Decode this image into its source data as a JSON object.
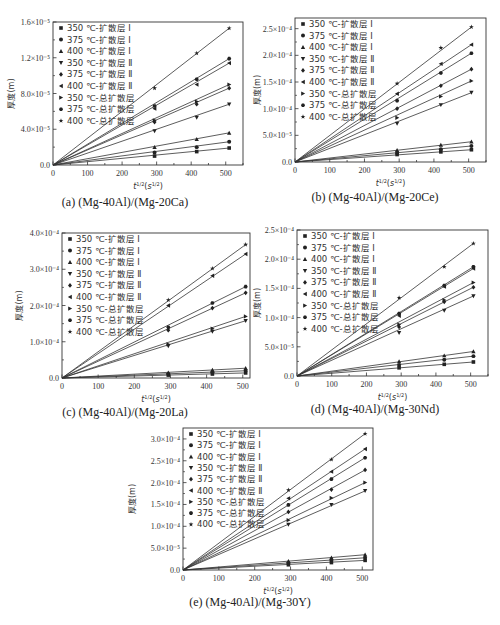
{
  "legend_labels": [
    "350 ℃-扩散层 Ⅰ",
    "375 ℃-扩散层 Ⅰ",
    "400 ℃-扩散层 Ⅰ",
    "350 ℃-扩散层 Ⅱ",
    "375 ℃-扩散层 Ⅱ",
    "400 ℃-扩散层 Ⅱ",
    "350 ℃-总扩散层",
    "375 ℃-总扩散层",
    "400 ℃-总扩散层"
  ],
  "markers": [
    "square",
    "circle",
    "triangle-up",
    "triangle-down",
    "diamond",
    "triangle-left",
    "triangle-right",
    "hexagon",
    "star"
  ],
  "chart_data": [
    {
      "id": "a",
      "type": "line",
      "title": "(a) (Mg-40Al)/(Mg-20Ca)",
      "xlabel": "t^1/2(s^1/2)",
      "ylabel": "厚度(m)",
      "xlim": [
        0,
        550
      ],
      "xticks": [
        "0",
        "100",
        "200",
        "300",
        "400",
        "500"
      ],
      "ylim": [
        0,
        16
      ],
      "yticks": [
        "0.0",
        "4.0×10⁻⁵",
        "8.0×10⁻⁵",
        "1.2×10⁻⁵",
        "1.6×10⁻⁵"
      ],
      "ytick_values": [
        0,
        4,
        8,
        12,
        16
      ],
      "x": [
        294,
        416,
        510
      ],
      "series": [
        {
          "name": "350 ℃-扩散层 Ⅰ",
          "values": [
            1.0,
            1.5,
            1.9
          ]
        },
        {
          "name": "375 ℃-扩散层 Ⅰ",
          "values": [
            1.4,
            2.0,
            2.6
          ]
        },
        {
          "name": "400 ℃-扩散层 Ⅰ",
          "values": [
            2.0,
            2.9,
            3.6
          ]
        },
        {
          "name": "350 ℃-扩散层 Ⅱ",
          "values": [
            3.8,
            5.3,
            6.8
          ]
        },
        {
          "name": "375 ℃-扩散层 Ⅱ",
          "values": [
            4.8,
            6.8,
            8.6
          ]
        },
        {
          "name": "400 ℃-扩散层 Ⅱ",
          "values": [
            6.3,
            9.0,
            11.4
          ]
        },
        {
          "name": "350 ℃-总扩散层",
          "values": [
            5.0,
            7.1,
            9.0
          ]
        },
        {
          "name": "375 ℃-总扩散层",
          "values": [
            6.6,
            9.6,
            11.9
          ]
        },
        {
          "name": "400 ℃-总扩散层",
          "values": [
            8.6,
            12.5,
            15.3
          ]
        }
      ],
      "legend_position": "upper-left"
    },
    {
      "id": "b",
      "type": "line",
      "title": "(b) (Mg-40Al)/(Mg-20Ce)",
      "xlabel": "t^1/2(s^1/2)",
      "ylabel": "厚度(m)",
      "xlim": [
        0,
        550
      ],
      "xticks": [
        "0",
        "100",
        "200",
        "300",
        "400",
        "500"
      ],
      "ylim": [
        0,
        2.7
      ],
      "yticks": [
        "0.0",
        "5.0×10⁻⁵",
        "1.0×10⁻⁴",
        "1.5×10⁻⁴",
        "2.0×10⁻⁴",
        "2.5×10⁻⁴"
      ],
      "ytick_values": [
        0,
        0.5,
        1.0,
        1.5,
        2.0,
        2.5
      ],
      "x": [
        294,
        420,
        508
      ],
      "series": [
        {
          "name": "350 ℃-扩散层 Ⅰ",
          "values": [
            0.14,
            0.19,
            0.23
          ]
        },
        {
          "name": "375 ℃-扩散层 Ⅰ",
          "values": [
            0.17,
            0.24,
            0.3
          ]
        },
        {
          "name": "400 ℃-扩散层 Ⅰ",
          "values": [
            0.22,
            0.32,
            0.38
          ]
        },
        {
          "name": "350 ℃-扩散层 Ⅱ",
          "values": [
            0.72,
            1.07,
            1.3
          ]
        },
        {
          "name": "375 ℃-扩散层 Ⅱ",
          "values": [
            1.0,
            1.43,
            1.74
          ]
        },
        {
          "name": "400 ℃-扩散层 Ⅱ",
          "values": [
            1.28,
            1.84,
            2.2
          ]
        },
        {
          "name": "350 ℃-总扩散层",
          "values": [
            0.83,
            1.23,
            1.52
          ]
        },
        {
          "name": "375 ℃-总扩散层",
          "values": [
            1.15,
            1.67,
            2.04
          ]
        },
        {
          "name": "400 ℃-总扩散层",
          "values": [
            1.47,
            2.14,
            2.53
          ]
        }
      ],
      "legend_position": "upper-left"
    },
    {
      "id": "c",
      "type": "line",
      "title": "(c) (Mg-40Al)/(Mg-20La)",
      "xlabel": "t^1/2(s^1/2)",
      "ylabel": "厚度(m)",
      "xlim": [
        0,
        520
      ],
      "xticks": [
        "0",
        "100",
        "200",
        "300",
        "400",
        "500"
      ],
      "ylim": [
        0,
        4.0
      ],
      "yticks": [
        "0.0",
        "1.0×10⁻⁴",
        "2.0×10⁻⁴",
        "3.0×10⁻⁴",
        "4.0×10⁻⁴"
      ],
      "ytick_values": [
        0,
        1.0,
        2.0,
        3.0,
        4.0
      ],
      "x": [
        294,
        416,
        508
      ],
      "series": [
        {
          "name": "350 ℃-扩散层 Ⅰ",
          "values": [
            0.08,
            0.11,
            0.14
          ]
        },
        {
          "name": "375 ℃-扩散层 Ⅰ",
          "values": [
            0.11,
            0.16,
            0.2
          ]
        },
        {
          "name": "400 ℃-扩散层 Ⅰ",
          "values": [
            0.15,
            0.22,
            0.27
          ]
        },
        {
          "name": "350 ℃-扩散层 Ⅱ",
          "values": [
            0.88,
            1.28,
            1.58
          ]
        },
        {
          "name": "375 ℃-扩散层 Ⅱ",
          "values": [
            1.32,
            1.93,
            2.35
          ]
        },
        {
          "name": "400 ℃-扩散层 Ⅱ",
          "values": [
            2.0,
            2.82,
            3.42
          ]
        },
        {
          "name": "350 ℃-总扩散层",
          "values": [
            0.93,
            1.36,
            1.7
          ]
        },
        {
          "name": "375 ℃-总扩散层",
          "values": [
            1.4,
            2.07,
            2.52
          ]
        },
        {
          "name": "400 ℃-总扩散层",
          "values": [
            2.15,
            3.02,
            3.68
          ]
        }
      ],
      "legend_position": "upper-left"
    },
    {
      "id": "d",
      "type": "line",
      "title": "(d) (Mg-40Al)/(Mg-30Nd)",
      "xlabel": "t^1/2(s^1/2)",
      "ylabel": "厚度(m)",
      "xlim": [
        0,
        550
      ],
      "xticks": [
        "0",
        "100",
        "200",
        "300",
        "400",
        "500"
      ],
      "ylim": [
        0,
        2.5
      ],
      "yticks": [
        "0.0",
        "5.0×10⁻⁵",
        "1.0×10⁻⁴",
        "1.5×10⁻⁴",
        "2.0×10⁻⁴",
        "2.5×10⁻⁴"
      ],
      "ytick_values": [
        0,
        0.5,
        1.0,
        1.5,
        2.0,
        2.5
      ],
      "x": [
        294,
        424,
        508
      ],
      "series": [
        {
          "name": "350 ℃-扩散层 Ⅰ",
          "values": [
            0.14,
            0.2,
            0.24
          ]
        },
        {
          "name": "375 ℃-扩散层 Ⅰ",
          "values": [
            0.19,
            0.28,
            0.34
          ]
        },
        {
          "name": "400 ℃-扩散层 Ⅰ",
          "values": [
            0.25,
            0.35,
            0.42
          ]
        },
        {
          "name": "350 ℃-扩散层 Ⅱ",
          "values": [
            0.74,
            1.12,
            1.37
          ]
        },
        {
          "name": "375 ℃-扩散层 Ⅱ",
          "values": [
            0.84,
            1.27,
            1.52
          ]
        },
        {
          "name": "400 ℃-扩散层 Ⅱ",
          "values": [
            1.03,
            1.53,
            1.84
          ]
        },
        {
          "name": "350 ℃-总扩散层",
          "values": [
            0.88,
            1.3,
            1.6
          ]
        },
        {
          "name": "375 ℃-总扩散层",
          "values": [
            1.07,
            1.55,
            1.87
          ]
        },
        {
          "name": "400 ℃-总扩散层",
          "values": [
            1.34,
            1.87,
            2.27
          ]
        }
      ],
      "legend_position": "upper-left"
    },
    {
      "id": "e",
      "type": "line",
      "title": "(e) (Mg-40Al)/(Mg-30Y)",
      "xlabel": "t^1/2(s^1/2)",
      "ylabel": "厚度(m)",
      "xlim": [
        0,
        530
      ],
      "xticks": [
        "0",
        "100",
        "200",
        "300",
        "400",
        "500"
      ],
      "ylim": [
        0,
        3.25
      ],
      "yticks": [
        "0.0",
        "5.0×10⁻⁵",
        "1.0×10⁻⁴",
        "1.5×10⁻⁴",
        "2.0×10⁻⁴",
        "2.5×10⁻⁴",
        "3.0×10⁻⁴"
      ],
      "ytick_values": [
        0,
        0.5,
        1.0,
        1.5,
        2.0,
        2.5,
        3.0
      ],
      "x": [
        294,
        414,
        508
      ],
      "series": [
        {
          "name": "350 ℃-扩散层 Ⅰ",
          "values": [
            0.12,
            0.17,
            0.22
          ]
        },
        {
          "name": "375 ℃-扩散层 Ⅰ",
          "values": [
            0.16,
            0.23,
            0.28
          ]
        },
        {
          "name": "400 ℃-扩散层 Ⅰ",
          "values": [
            0.2,
            0.28,
            0.35
          ]
        },
        {
          "name": "350 ℃-扩散层 Ⅱ",
          "values": [
            1.04,
            1.49,
            1.81
          ]
        },
        {
          "name": "375 ℃-扩散层 Ⅱ",
          "values": [
            1.33,
            1.84,
            2.29
          ]
        },
        {
          "name": "400 ℃-扩散层 Ⅱ",
          "values": [
            1.64,
            2.25,
            2.77
          ]
        },
        {
          "name": "350 ℃-总扩散层",
          "values": [
            1.14,
            1.65,
            2.0
          ]
        },
        {
          "name": "375 ℃-总扩散层",
          "values": [
            1.49,
            2.08,
            2.57
          ]
        },
        {
          "name": "400 ℃-总扩散层",
          "values": [
            1.83,
            2.53,
            3.12
          ]
        }
      ],
      "legend_position": "upper-left"
    }
  ],
  "layout": {
    "panels": [
      {
        "id": "a",
        "left": 0,
        "top": 0,
        "width": 250,
        "height": 215,
        "plot": {
          "x0": 53,
          "y0": 22,
          "x1": 243,
          "y1": 165
        },
        "caption_top": 195
      },
      {
        "id": "b",
        "left": 250,
        "top": 0,
        "width": 250,
        "height": 215,
        "plot": {
          "x0": 45,
          "y0": 18,
          "x1": 236,
          "y1": 162
        },
        "caption_top": 190
      },
      {
        "id": "c",
        "left": 0,
        "top": 215,
        "width": 250,
        "height": 200,
        "plot": {
          "x0": 62,
          "y0": 18,
          "x1": 250,
          "y1": 163
        },
        "caption_top": 190
      },
      {
        "id": "d",
        "left": 250,
        "top": 215,
        "width": 250,
        "height": 200,
        "plot": {
          "x0": 47,
          "y0": 15,
          "x1": 238,
          "y1": 161
        },
        "caption_top": 187
      },
      {
        "id": "e",
        "left": 125,
        "top": 415,
        "width": 250,
        "height": 210,
        "plot": {
          "x0": 58,
          "y0": 13,
          "x1": 248,
          "y1": 155
        },
        "caption_top": 180
      }
    ]
  }
}
